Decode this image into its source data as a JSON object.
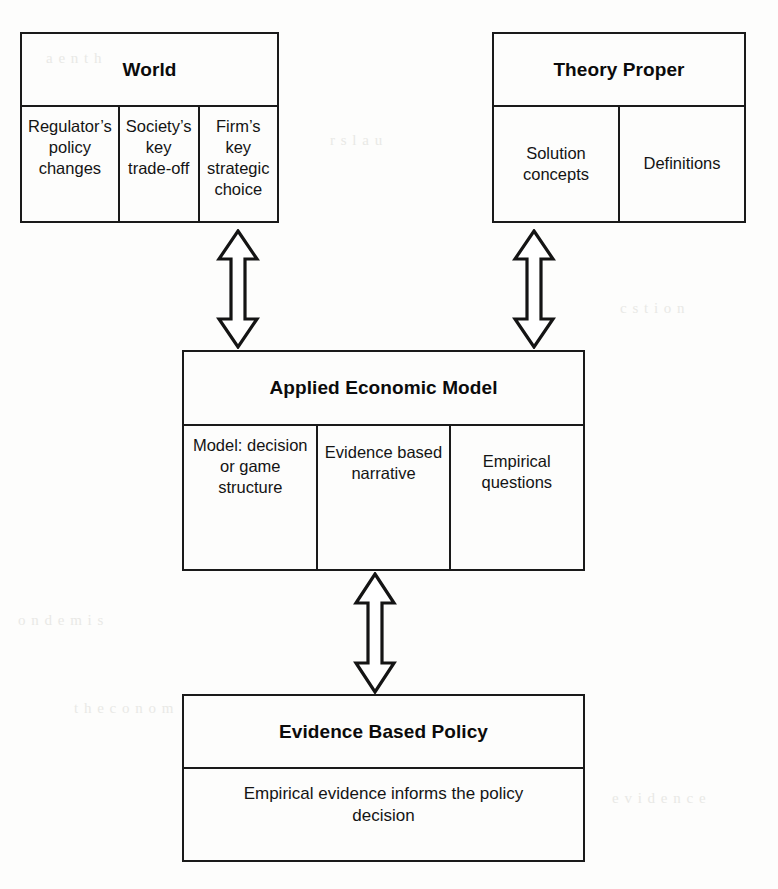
{
  "diagram": {
    "ink_color": "#1a1a1a",
    "paper_color": "#fdfdfc"
  },
  "boxes": {
    "world": {
      "title": "World",
      "cells": [
        "Regulator’s policy changes",
        "Society’s key trade-off",
        "Firm’s key strategic choice"
      ]
    },
    "theory": {
      "title": "Theory Proper",
      "cells": [
        "Solution concepts",
        "Definitions"
      ]
    },
    "model": {
      "title": "Applied Economic Model",
      "cells": [
        "Model: decision or game structure",
        "Evidence based narrative",
        "Empirical questions"
      ]
    },
    "policy": {
      "title": "Evidence Based Policy",
      "cells": [
        "Empirical evidence informs the policy decision"
      ]
    }
  },
  "connectors": [
    {
      "id": "world-model",
      "icon": "double-headed-vertical-arrow",
      "from": "World",
      "to": "Applied Economic Model"
    },
    {
      "id": "theory-model",
      "icon": "double-headed-vertical-arrow",
      "from": "Theory Proper",
      "to": "Applied Economic Model"
    },
    {
      "id": "model-policy",
      "icon": "double-headed-vertical-arrow",
      "from": "Applied Economic Model",
      "to": "Evidence Based Policy"
    }
  ],
  "artifacts": {
    "marks": [
      "a  e  n t  h",
      "r   s  l   a  u",
      "o  n  d  e  m  i  s",
      "t h e  c  o  n  o  m",
      "c   s   t  i  o  n",
      "e  v  i  d  e  n  c  e"
    ]
  }
}
